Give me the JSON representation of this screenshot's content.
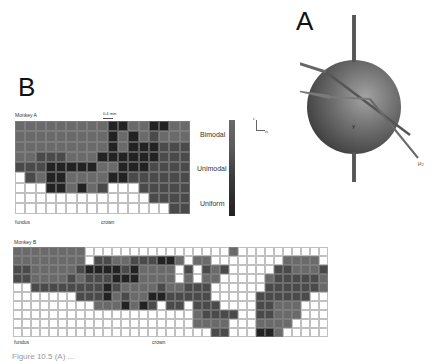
{
  "figure": {
    "panelA": {
      "label": "A",
      "axis_labels": [
        "μ₁",
        "μ₂",
        "γ"
      ],
      "colors": {
        "sphere": "#6d6d6d",
        "sphere_highlight": "#9a9a9a",
        "rod": "#555555"
      }
    },
    "panelB": {
      "label": "B",
      "axes_glyph": {
        "y": "x",
        "x": "zs"
      },
      "legend": {
        "items": [
          "Bimodal",
          "Unimodal",
          "Uniform"
        ],
        "colors": {
          "Bimodal": "#6a6a6a",
          "Unimodal": "#4a4a4a",
          "Uniform": "#222222",
          "none": "#ffffff"
        }
      },
      "monkeyA": {
        "title": "Monkey A",
        "scale": "0.4 mm",
        "left_label": "fundus",
        "center_label": "crown",
        "rows": [
          "33333333311331133",
          "33333333313132333",
          "33333333313111222",
          "33222333111111222",
          "22211111331112222",
          "02311333311222222",
          "00011313200022222",
          "00000000000002222",
          "00000000000000022"
        ]
      },
      "monkeyB": {
        "title": "Monkey B",
        "left_label": "fundus",
        "center_label": "crown",
        "rows": [
          "33333333000000000000000030000000000",
          "33333333022332221130330000000033330",
          "22333332111121333302023200000223332",
          "22333323222111333303033000003222223",
          "00222222221233332332220000002222223",
          "00000002221323311222220000022222200",
          "00000000033313120220222000022333000",
          "00000000000000000000322220022333000",
          "00000000000000000000333300033330000",
          "00000000000000000000002200011300000"
        ]
      }
    },
    "caption": "Figure 10.5  (A) ..."
  }
}
